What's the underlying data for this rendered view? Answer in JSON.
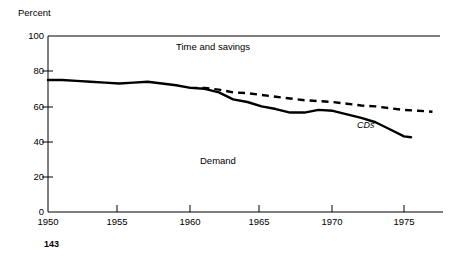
{
  "page": {
    "page_number": "143"
  },
  "chart_data": {
    "type": "line",
    "title": "",
    "ylabel": "Percent",
    "xlabel": "",
    "ylim": [
      0,
      100
    ],
    "xlim": [
      1950,
      1977
    ],
    "grid": false,
    "legend": "inline-annotations",
    "ytick_labels": [
      "0",
      "20",
      "40",
      "60",
      "80",
      "100"
    ],
    "yticks": [
      0,
      20,
      40,
      60,
      80,
      100
    ],
    "xtick_labels": [
      "1950",
      "1955",
      "1960",
      "1965",
      "1970",
      "1975"
    ],
    "xticks": [
      1950,
      1955,
      1960,
      1965,
      1970,
      1975
    ],
    "annotations": [
      {
        "name": "time-and-savings",
        "text": "Time and savings"
      },
      {
        "name": "demand",
        "text": "Demand"
      },
      {
        "name": "cds",
        "text": "CDs"
      }
    ],
    "series": [
      {
        "name": "Demand",
        "style": "solid",
        "x": [
          1950,
          1951,
          1952,
          1953,
          1954,
          1955,
          1956,
          1957,
          1958,
          1959,
          1960,
          1961,
          1962,
          1963,
          1964,
          1965,
          1966,
          1967,
          1968,
          1969,
          1970,
          1971,
          1972,
          1973,
          1974,
          1975,
          1975.5
        ],
        "values": [
          75,
          75,
          74.5,
          74,
          73.5,
          73,
          73.5,
          74,
          73,
          72,
          70.5,
          70,
          68,
          64,
          62.5,
          60,
          58.5,
          56.5,
          56.5,
          58,
          57.5,
          55.5,
          53.5,
          51,
          47,
          43,
          42.5
        ]
      },
      {
        "name": "Time and savings",
        "style": "dashed",
        "x": [
          1960,
          1961,
          1962,
          1963,
          1964,
          1965,
          1966,
          1967,
          1968,
          1969,
          1970,
          1971,
          1972,
          1973,
          1974,
          1975,
          1976,
          1977
        ],
        "values": [
          70.5,
          70.5,
          69.5,
          68,
          67.5,
          66.5,
          65.5,
          64.5,
          63.5,
          63,
          62.5,
          61.5,
          60.5,
          60,
          59,
          58,
          57.5,
          57
        ]
      }
    ]
  }
}
